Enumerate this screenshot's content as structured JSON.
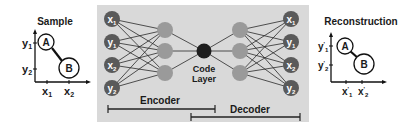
{
  "diagram": {
    "type": "autoencoder",
    "colors": {
      "panel_bg": "#d9d9d9",
      "io_node": "#5a5a5a",
      "hidden_node": "#9a9a9a",
      "code_node": "#1e1e1e",
      "edge": "#2a2a2a",
      "text": "#1a1a1a"
    },
    "sample_plot": {
      "title": "Sample",
      "y_labels": [
        "y1",
        "y2"
      ],
      "x_labels": [
        "x1",
        "x2"
      ],
      "points": [
        {
          "label": "A"
        },
        {
          "label": "B"
        }
      ]
    },
    "reconstruction_plot": {
      "title": "Reconstruction",
      "y_labels": [
        "y1'",
        "y2'"
      ],
      "x_labels": [
        "x1'",
        "x2'"
      ],
      "points": [
        {
          "label": "A"
        },
        {
          "label": "B"
        }
      ]
    },
    "network": {
      "input_nodes": [
        "x1",
        "y1",
        "x2",
        "y2"
      ],
      "output_nodes": [
        "x1'",
        "y1'",
        "x2'",
        "y2'"
      ],
      "hidden_layer_size": 3,
      "code_layer_label_line1": "Code",
      "code_layer_label_line2": "Layer",
      "encoder_label": "Encoder",
      "decoder_label": "Decoder"
    }
  }
}
